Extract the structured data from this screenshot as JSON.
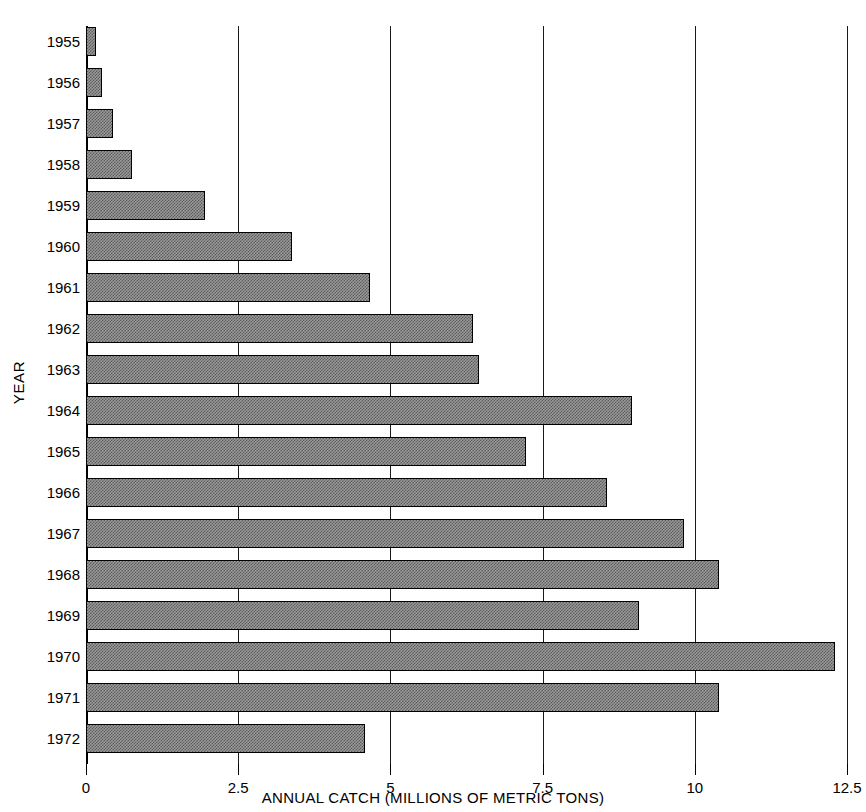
{
  "chart_data": {
    "type": "bar",
    "orientation": "horizontal",
    "title": "",
    "xlabel": "ANNUAL CATCH (MILLIONS OF METRIC TONS)",
    "ylabel": "YEAR",
    "xlim": [
      0,
      12.5
    ],
    "xticks": [
      0,
      2.5,
      5,
      7.5,
      10,
      12.5
    ],
    "xticklabels": [
      "0",
      "2.5",
      "5",
      "7.5",
      "10",
      "12.5"
    ],
    "grid": "vertical",
    "legend": "none",
    "categories": [
      "1955",
      "1956",
      "1957",
      "1958",
      "1959",
      "1960",
      "1961",
      "1962",
      "1963",
      "1964",
      "1965",
      "1966",
      "1967",
      "1968",
      "1969",
      "1970",
      "1971",
      "1972"
    ],
    "values": [
      0.17,
      0.26,
      0.44,
      0.76,
      1.95,
      3.38,
      4.67,
      6.35,
      6.45,
      8.97,
      7.23,
      8.56,
      9.83,
      10.4,
      9.08,
      12.31,
      10.4,
      4.58
    ],
    "bar_fill_color": "#8a8a8a",
    "bar_edge_color": "#000000",
    "axis_color": "#000000",
    "background_color": "#ffffff"
  }
}
